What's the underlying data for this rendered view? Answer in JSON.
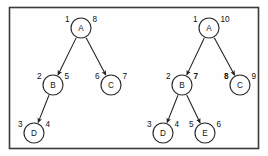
{
  "figure": {
    "frame": {
      "border_color": "#3a3a3a",
      "background_color": "#fefefe"
    },
    "node_color": "#ffffff",
    "stroke_color": "#2b2b2b",
    "edge_color": "#1f1f1f"
  },
  "trees": [
    {
      "id": "left-tree",
      "name": "Tree 1",
      "nodes": [
        {
          "id": "A",
          "label": "A",
          "discovery": "1",
          "finish": "8",
          "discovery_bold": false,
          "finish_bold": false,
          "cx": 81,
          "cy": 28,
          "r": 10
        },
        {
          "id": "B",
          "label": "B",
          "discovery": "2",
          "finish": "5",
          "discovery_bold": false,
          "finish_bold": false,
          "cx": 53,
          "cy": 85,
          "r": 10
        },
        {
          "id": "C",
          "label": "C",
          "discovery": "6",
          "finish": "7",
          "discovery_bold": false,
          "finish_bold": false,
          "cx": 111,
          "cy": 85,
          "r": 10
        },
        {
          "id": "D",
          "label": "D",
          "discovery": "3",
          "finish": "4",
          "discovery_bold": false,
          "finish_bold": false,
          "cx": 34,
          "cy": 133,
          "r": 10
        }
      ],
      "edges": [
        {
          "from": "A",
          "to": "B"
        },
        {
          "from": "A",
          "to": "C"
        },
        {
          "from": "B",
          "to": "D"
        }
      ]
    },
    {
      "id": "right-tree",
      "name": "Tree 2",
      "nodes": [
        {
          "id": "A",
          "label": "A",
          "discovery": "1",
          "finish": "10",
          "discovery_bold": false,
          "finish_bold": false,
          "cx": 209,
          "cy": 28,
          "r": 10
        },
        {
          "id": "B",
          "label": "B",
          "discovery": "2",
          "finish": "7",
          "discovery_bold": false,
          "finish_bold": true,
          "cx": 182,
          "cy": 85,
          "r": 10
        },
        {
          "id": "C",
          "label": "C",
          "discovery": "8",
          "finish": "9",
          "discovery_bold": true,
          "finish_bold": false,
          "cx": 240,
          "cy": 85,
          "r": 10
        },
        {
          "id": "D",
          "label": "D",
          "discovery": "3",
          "finish": "4",
          "discovery_bold": false,
          "finish_bold": false,
          "cx": 163,
          "cy": 133,
          "r": 10
        },
        {
          "id": "E",
          "label": "E",
          "discovery": "5",
          "finish": "6",
          "discovery_bold": false,
          "finish_bold": false,
          "cx": 205,
          "cy": 133,
          "r": 10
        }
      ],
      "edges": [
        {
          "from": "A",
          "to": "B"
        },
        {
          "from": "A",
          "to": "C"
        },
        {
          "from": "B",
          "to": "D"
        },
        {
          "from": "B",
          "to": "E"
        }
      ]
    }
  ]
}
